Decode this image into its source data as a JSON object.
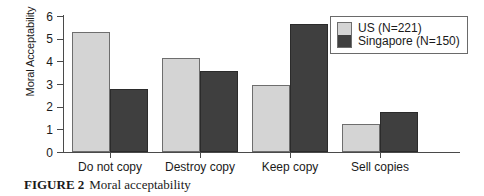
{
  "chart_data": {
    "type": "bar",
    "title": "Moral acceptability",
    "xlabel": "",
    "ylabel": "Moral Acceptability",
    "ylim": [
      0,
      6
    ],
    "yticks": [
      0,
      1,
      2,
      3,
      4,
      5,
      6
    ],
    "grid": false,
    "legend_position": "top-right",
    "categories": [
      "Do not copy",
      "Destroy copy",
      "Keep copy",
      "Sell copies"
    ],
    "series": [
      {
        "name": "US (N=221)",
        "values": [
          5.28,
          4.15,
          2.95,
          1.23
        ],
        "color": "#d4d4d4"
      },
      {
        "name": "Singapore (N=150)",
        "values": [
          2.77,
          3.58,
          5.64,
          1.77
        ],
        "color": "#3f3f3f"
      }
    ]
  },
  "axis": {
    "y_title": "Moral Acceptability",
    "y_tick_labels": [
      "0",
      "1",
      "2",
      "3",
      "4",
      "5",
      "6"
    ]
  },
  "legend": {
    "entries": [
      {
        "label": "US (N=221)"
      },
      {
        "label": "Singapore (N=150)"
      }
    ]
  },
  "caption": {
    "label": "FIGURE 2",
    "text": "Moral acceptability"
  }
}
